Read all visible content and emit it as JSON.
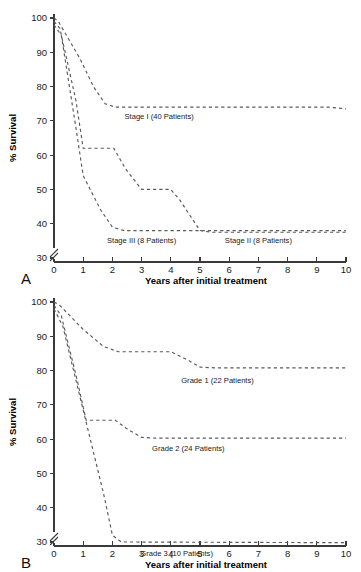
{
  "figure": {
    "width": 361,
    "height": 572,
    "background": "#ffffff",
    "line_color": "#5a5a5a",
    "axis_color": "#3a3a3a",
    "text_color": "#1a1a1a"
  },
  "panels": [
    {
      "letter": "A",
      "name": "panel-a",
      "axis_title_x": "Years after initial treatment",
      "axis_title_y": "% Survival",
      "x_ticks": [
        "0",
        "1",
        "2",
        "3",
        "4",
        "5",
        "6",
        "7",
        "8",
        "9",
        "10"
      ],
      "y_ticks": [
        "30",
        "40",
        "50",
        "60",
        "70",
        "80",
        "90",
        "100"
      ],
      "axis_break": true,
      "series": [
        {
          "label": "Stage I (40 Patients)",
          "label_x": 3.6,
          "label_y": 70.5,
          "points": [
            [
              0,
              100
            ],
            [
              0.15,
              99
            ],
            [
              0.9,
              88
            ],
            [
              1.35,
              80
            ],
            [
              1.75,
              75
            ],
            [
              2.1,
              74
            ],
            [
              9.4,
              74
            ],
            [
              10,
              73.5
            ]
          ]
        },
        {
          "label": "Stage II (8 Patients)",
          "label_x": 7.0,
          "label_y": 34.5,
          "points": [
            [
              0,
              99
            ],
            [
              0.2,
              97
            ],
            [
              0.75,
              76
            ],
            [
              1.0,
              62
            ],
            [
              2.05,
              62
            ],
            [
              2.45,
              56
            ],
            [
              3.0,
              50
            ],
            [
              4.0,
              50
            ],
            [
              4.3,
              47
            ],
            [
              5.0,
              38
            ],
            [
              5.4,
              37.5
            ],
            [
              10,
              37.5
            ]
          ]
        },
        {
          "label": "Stage III (8 Patients)",
          "label_x": 3.0,
          "label_y": 34.5,
          "points": [
            [
              0,
              98
            ],
            [
              0.25,
              95
            ],
            [
              0.75,
              68
            ],
            [
              1.0,
              54
            ],
            [
              1.6,
              44
            ],
            [
              2.0,
              39
            ],
            [
              2.4,
              38
            ],
            [
              10,
              38
            ]
          ]
        }
      ]
    },
    {
      "letter": "B",
      "name": "panel-b",
      "axis_title_x": "Years after initial treatment",
      "axis_title_y": "% Survival",
      "x_ticks": [
        "0",
        "1",
        "2",
        "3",
        "4",
        "5",
        "6",
        "7",
        "8",
        "9",
        "10"
      ],
      "y_ticks": [
        "30",
        "40",
        "50",
        "60",
        "70",
        "80",
        "90",
        "100"
      ],
      "axis_break": true,
      "series": [
        {
          "label": "Grade 1 (22 Patients)",
          "label_x": 5.6,
          "label_y": 76.5,
          "points": [
            [
              0,
              100
            ],
            [
              0.2,
              99
            ],
            [
              1.0,
              92
            ],
            [
              1.7,
              87
            ],
            [
              2.2,
              85.5
            ],
            [
              4.0,
              85.5
            ],
            [
              4.6,
              83
            ],
            [
              5.0,
              81
            ],
            [
              5.5,
              80.8
            ],
            [
              10,
              80.8
            ]
          ]
        },
        {
          "label": "Grade 2 (24 Patients)",
          "label_x": 4.6,
          "label_y": 56.5,
          "points": [
            [
              0,
              99
            ],
            [
              0.25,
              96
            ],
            [
              0.8,
              77
            ],
            [
              1.1,
              65.5
            ],
            [
              2.1,
              65.5
            ],
            [
              2.5,
              63
            ],
            [
              3.0,
              60.5
            ],
            [
              3.5,
              60.3
            ],
            [
              10,
              60.3
            ]
          ]
        },
        {
          "label": "Grade 3 (10 Patients)",
          "label_x": 4.2,
          "label_y": 26.0,
          "points": [
            [
              0,
              98
            ],
            [
              0.3,
              93
            ],
            [
              0.9,
              72
            ],
            [
              1.3,
              58
            ],
            [
              1.7,
              44
            ],
            [
              2.0,
              32
            ],
            [
              2.3,
              30
            ],
            [
              10,
              29.8
            ]
          ]
        }
      ]
    }
  ],
  "chart_data": [
    {
      "type": "line",
      "panel": "A",
      "title": "Survival by stage",
      "xlabel": "Years after initial treatment",
      "ylabel": "% Survival",
      "xlim": [
        0,
        10
      ],
      "ylim": [
        25,
        100
      ],
      "y_axis_break_below": 30,
      "grid": false,
      "legend": "inline-labels",
      "x": [
        0,
        1,
        2,
        3,
        4,
        5,
        6,
        7,
        8,
        9,
        10
      ],
      "series": [
        {
          "name": "Stage I (40 Patients)",
          "n_patients": 40,
          "values": [
            100,
            88,
            74,
            74,
            74,
            74,
            74,
            74,
            74,
            74,
            73.5
          ]
        },
        {
          "name": "Stage II (8 Patients)",
          "n_patients": 8,
          "values": [
            99,
            62,
            62,
            50,
            50,
            38,
            37.5,
            37.5,
            37.5,
            37.5,
            37.5
          ]
        },
        {
          "name": "Stage III (8 Patients)",
          "n_patients": 8,
          "values": [
            98,
            54,
            39,
            38,
            38,
            38,
            38,
            38,
            38,
            38,
            38
          ]
        }
      ]
    },
    {
      "type": "line",
      "panel": "B",
      "title": "Survival by grade",
      "xlabel": "Years after initial treatment",
      "ylabel": "% Survival",
      "xlim": [
        0,
        10
      ],
      "ylim": [
        25,
        100
      ],
      "y_axis_break_below": 30,
      "grid": false,
      "legend": "inline-labels",
      "x": [
        0,
        1,
        2,
        3,
        4,
        5,
        6,
        7,
        8,
        9,
        10
      ],
      "series": [
        {
          "name": "Grade 1 (22 Patients)",
          "n_patients": 22,
          "values": [
            100,
            92,
            85.5,
            85.5,
            85.5,
            81,
            80.8,
            80.8,
            80.8,
            80.8,
            80.8
          ]
        },
        {
          "name": "Grade 2 (24 Patients)",
          "n_patients": 24,
          "values": [
            99,
            65.5,
            65.5,
            60.5,
            60.3,
            60.3,
            60.3,
            60.3,
            60.3,
            60.3,
            60.3
          ]
        },
        {
          "name": "Grade 3 (10 Patients)",
          "n_patients": 10,
          "values": [
            98,
            58,
            32,
            30,
            30,
            30,
            30,
            29.8,
            29.8,
            29.8,
            29.8
          ]
        }
      ]
    }
  ]
}
